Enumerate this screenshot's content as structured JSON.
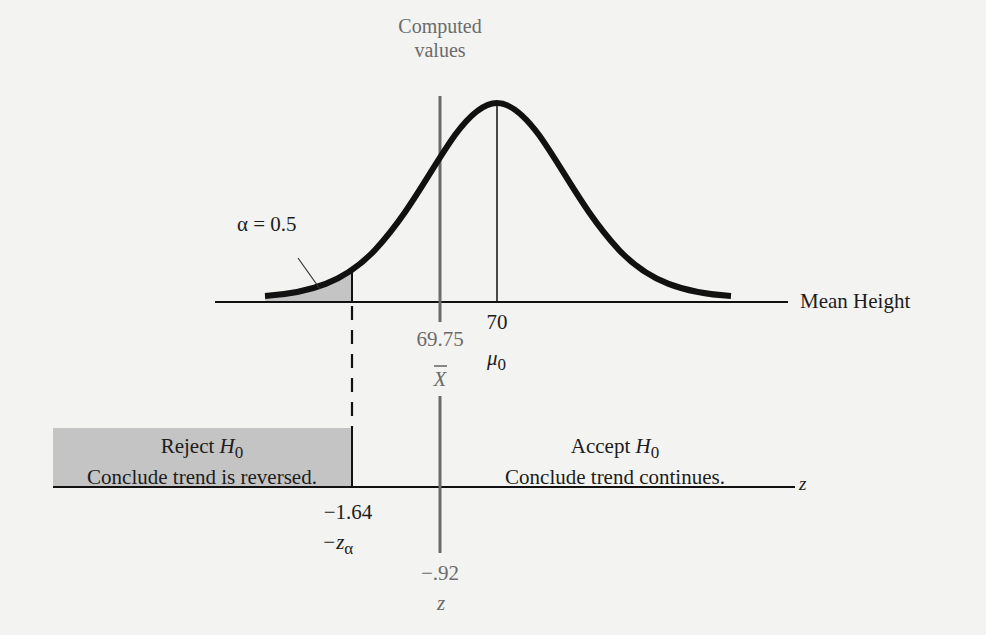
{
  "figure": {
    "computed_label_line1": "Computed",
    "computed_label_line2": "values",
    "alpha_label": "α = 0.5",
    "x_axis_label": "Mean Height",
    "z_axis_label": "z",
    "xbar_value": "69.75",
    "xbar_symbol": "X",
    "mu_value": "70",
    "mu_symbol": "μ",
    "mu_subscript": "0",
    "critical_value": "−1.64",
    "critical_symbol": "−z",
    "critical_subscript": "α",
    "computed_z_value": "−.92",
    "computed_z_symbol": "z",
    "reject_region": {
      "title": "Reject",
      "hypothesis": "H",
      "subscript": "0",
      "conclusion": "Conclude trend is reversed."
    },
    "accept_region": {
      "title": "Accept",
      "hypothesis": "H",
      "subscript": "0",
      "conclusion": "Conclude trend continues."
    }
  },
  "colors": {
    "background": "#f3f3f1",
    "curve": "#111111",
    "shade": "#c4c4c4",
    "computed_line": "#6b6b6b",
    "text": "#1c1c1c"
  }
}
